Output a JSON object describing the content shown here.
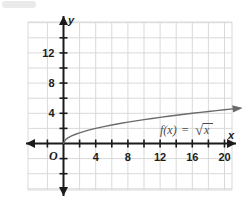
{
  "chart_data": {
    "type": "line",
    "title": "",
    "subtitle": "",
    "xlabel": "x",
    "ylabel": "y",
    "function_label": "f(x) = √x",
    "function_label_parts": {
      "name": "f(x)",
      "equals": "=",
      "radical": "√",
      "radicand": "x"
    },
    "origin_label": "O",
    "xlim": [
      -3,
      23
    ],
    "ylim": [
      -5.5,
      15.5
    ],
    "xticks_labeled": [
      4,
      8,
      12,
      16,
      20
    ],
    "xtick_labels": [
      "4",
      "8",
      "12",
      "16",
      "20"
    ],
    "yticks_labeled": [
      4,
      8,
      12
    ],
    "ytick_labels": [
      "4",
      "8",
      "12"
    ],
    "tick_step": 2,
    "grid": true,
    "grid_step": 2,
    "legend": "none",
    "series": [
      {
        "name": "f(x) = √x",
        "x": [
          0,
          0.25,
          0.5,
          1,
          1.5,
          2,
          3,
          4,
          5,
          6,
          7,
          8,
          9,
          10,
          11,
          12,
          13,
          14,
          15,
          16,
          17,
          18,
          19,
          20,
          21,
          22
        ],
        "values": [
          0,
          0.5,
          0.707,
          1,
          1.225,
          1.414,
          1.732,
          2,
          2.236,
          2.449,
          2.646,
          2.828,
          3,
          3.162,
          3.317,
          3.464,
          3.606,
          3.742,
          3.873,
          4,
          4.123,
          4.243,
          4.359,
          4.472,
          4.583,
          4.69
        ],
        "arrow_end": true,
        "color": "#6b6b6b"
      }
    ],
    "colors": {
      "background": "#ffffff",
      "grid": "#d9d9d9",
      "axis": "#1b1b1b",
      "curve": "#6b6b6b",
      "text": "#1b1b1b",
      "label_text": "#4a4a4a"
    }
  }
}
